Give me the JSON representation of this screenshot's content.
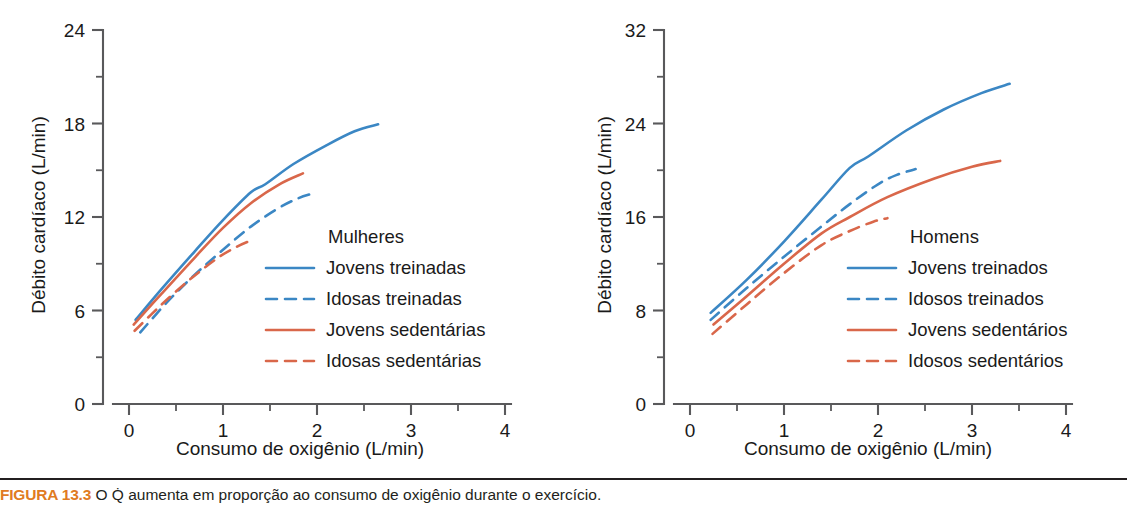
{
  "figure": {
    "caption_number": "FIGURA 13.3",
    "caption_text": " O Q̇ aumenta em proporção ao consumo de oxigênio durante o exercício.",
    "background": "#ffffff",
    "rule_color": "#231f20"
  },
  "colors": {
    "blue": "#3b87c4",
    "red": "#d9674a",
    "axis": "#59595b",
    "text": "#1a1a1a",
    "caption_orange": "#e07b22"
  },
  "chart_data": [
    {
      "type": "line",
      "panel": "left",
      "title": "Mulheres",
      "xlabel": "Consumo de oxigênio (L/min)",
      "ylabel": "Débito cardíaco (L/min)",
      "xlim": [
        0,
        4
      ],
      "ylim": [
        0,
        24
      ],
      "xticks": [
        0,
        1,
        2,
        3,
        4
      ],
      "xtick_labels": [
        "0",
        "1",
        "2",
        "3",
        "4"
      ],
      "xminor_step": 0.5,
      "yticks": [
        0,
        6,
        12,
        18,
        24
      ],
      "ytick_labels": [
        "0",
        "6",
        "12",
        "18",
        "24"
      ],
      "yminor": [
        3,
        9,
        15,
        21
      ],
      "grid": false,
      "legend_position": "center-right",
      "series": [
        {
          "name": "Jovens treinadas",
          "color": "#3b87c4",
          "style": "solid",
          "x": [
            0.07,
            0.35,
            0.7,
            1.0,
            1.3,
            1.45,
            1.75,
            2.1,
            2.4,
            2.65
          ],
          "y": [
            5.4,
            7.4,
            9.8,
            11.8,
            13.6,
            14.1,
            15.4,
            16.6,
            17.5,
            17.95
          ]
        },
        {
          "name": "Idosas treinadas",
          "color": "#3b87c4",
          "style": "dashed",
          "x": [
            0.12,
            0.4,
            0.7,
            1.0,
            1.3,
            1.6,
            1.8,
            1.95
          ],
          "y": [
            4.6,
            6.5,
            8.3,
            9.9,
            11.4,
            12.6,
            13.2,
            13.5
          ]
        },
        {
          "name": "Jovens sedentárias",
          "color": "#d9674a",
          "style": "solid",
          "x": [
            0.05,
            0.35,
            0.7,
            1.0,
            1.3,
            1.6,
            1.85
          ],
          "y": [
            5.1,
            7.1,
            9.4,
            11.3,
            12.9,
            14.1,
            14.8
          ]
        },
        {
          "name": "Idosas sedentárias",
          "color": "#d9674a",
          "style": "dashed",
          "x": [
            0.06,
            0.35,
            0.65,
            0.95,
            1.15,
            1.3
          ],
          "y": [
            4.7,
            6.4,
            8.0,
            9.4,
            10.1,
            10.5
          ]
        }
      ]
    },
    {
      "type": "line",
      "panel": "right",
      "title": "Homens",
      "xlabel": "Consumo de oxigênio (L/min)",
      "ylabel": "Débito cardíaco (L/min)",
      "xlim": [
        0,
        4
      ],
      "ylim": [
        0,
        32
      ],
      "xticks": [
        0,
        1,
        2,
        3,
        4
      ],
      "xtick_labels": [
        "0",
        "1",
        "2",
        "3",
        "4"
      ],
      "xminor_step": 0.5,
      "yticks": [
        0,
        8,
        16,
        24,
        32
      ],
      "ytick_labels": [
        "0",
        "8",
        "16",
        "24",
        "32"
      ],
      "yminor": [
        4,
        12,
        20,
        28
      ],
      "grid": false,
      "legend_position": "center-right",
      "series": [
        {
          "name": "Jovens treinados",
          "color": "#3b87c4",
          "style": "solid",
          "x": [
            0.22,
            0.6,
            1.0,
            1.4,
            1.7,
            1.9,
            2.3,
            2.7,
            3.1,
            3.4
          ],
          "y": [
            7.8,
            10.6,
            13.9,
            17.5,
            20.2,
            21.2,
            23.4,
            25.2,
            26.6,
            27.4
          ]
        },
        {
          "name": "Idosos treinados",
          "color": "#3b87c4",
          "style": "dashed",
          "x": [
            0.22,
            0.6,
            1.0,
            1.4,
            1.7,
            2.0,
            2.2,
            2.4
          ],
          "y": [
            7.2,
            9.9,
            12.6,
            15.2,
            17.1,
            18.8,
            19.6,
            20.1
          ]
        },
        {
          "name": "Jovens sedentários",
          "color": "#d9674a",
          "style": "solid",
          "x": [
            0.25,
            0.6,
            1.0,
            1.4,
            1.7,
            2.1,
            2.6,
            3.0,
            3.3
          ],
          "y": [
            6.8,
            9.2,
            12.0,
            14.6,
            16.0,
            17.7,
            19.3,
            20.3,
            20.8
          ]
        },
        {
          "name": "Idosos sedentários",
          "color": "#d9674a",
          "style": "dashed",
          "x": [
            0.24,
            0.6,
            1.0,
            1.4,
            1.7,
            1.95,
            2.1
          ],
          "y": [
            6.0,
            8.5,
            11.2,
            13.6,
            14.8,
            15.6,
            15.9
          ]
        }
      ]
    }
  ]
}
